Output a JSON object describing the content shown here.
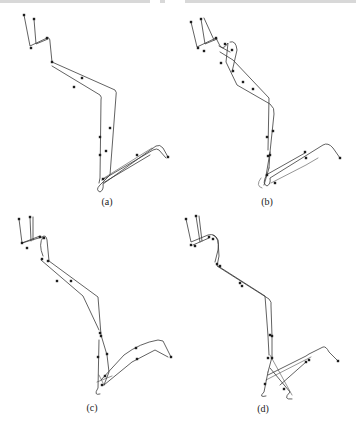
{
  "figure": {
    "top_strip_segments": [
      [
        0,
        150
      ],
      [
        160,
        165
      ],
      [
        185,
        356
      ]
    ],
    "panels": [
      {
        "id": "a",
        "label": "(a)",
        "label_pos": [
          107,
          196
        ],
        "paths": [
          "M24,15 L30,46 L47,38 Q50,37 50,42 L52,62 L115,90 Q117,92 116,96 L110,175 L100,185 Q95,190 100,192 Q104,190 103,184 L156,146 Q160,144 163,148 L168,157",
          "M34,19 L36,44 L48,39",
          "M52,66 L100,95 Q102,97 101,100 L100,178 L99,183",
          "M102,180 L153,150 Q157,148 159,150 L166,158",
          "M103,183 L150,155"
        ],
        "light_paths": [
          "M104,178 L152,148"
        ],
        "nodes": [
          [
            24,
            15
          ],
          [
            34,
            19
          ],
          [
            31,
            48
          ],
          [
            47,
            38
          ],
          [
            52,
            62
          ],
          [
            74,
            87
          ],
          [
            82,
            78
          ],
          [
            100,
            137
          ],
          [
            110,
            128
          ],
          [
            100,
            155
          ],
          [
            106,
            151
          ],
          [
            103,
            179
          ],
          [
            137,
            155
          ],
          [
            168,
            157
          ]
        ]
      },
      {
        "id": "b",
        "label": "(b)",
        "label_pos": [
          267,
          196
        ],
        "paths": [
          "M191,22 L197,47 L216,38 L219,44 Q222,52 228,43 L226,62 L237,85 L270,104 Q275,108 274,114 L270,152 L269,168",
          "M201,19 L205,44 L217,39",
          "M204,18 L214,40",
          "M219,46 L230,52",
          "M230,42 Q236,40 237,50 L232,72",
          "M220,52 L233,60 L269,98 L268,150",
          "M270,152 L266,176 Q262,184 267,186 Q271,184 270,178 L323,145 Q328,142 333,148 L340,158",
          "M269,168 L264,185",
          "M266,175 L305,153"
        ],
        "light_paths": [
          "M261,178 Q255,186 262,188",
          "M271,183 L306,165 L318,158"
        ],
        "nodes": [
          [
            191,
            22
          ],
          [
            201,
            19
          ],
          [
            198,
            48
          ],
          [
            204,
            51
          ],
          [
            216,
            38
          ],
          [
            225,
            44
          ],
          [
            232,
            50
          ],
          [
            221,
            63
          ],
          [
            233,
            71
          ],
          [
            243,
            82
          ],
          [
            253,
            89
          ],
          [
            267,
            137
          ],
          [
            273,
            131
          ],
          [
            268,
            156
          ],
          [
            270,
            155
          ],
          [
            267,
            175
          ],
          [
            275,
            183
          ],
          [
            305,
            152
          ],
          [
            306,
            158
          ],
          [
            340,
            158
          ]
        ]
      },
      {
        "id": "c",
        "label": "(c)",
        "label_pos": [
          92,
          402
        ],
        "paths": [
          "M19,219 L22,243 L42,237 Q46,234 47,240 L49,261 L98,297 L101,335 L107,355 L109,372 L104,385",
          "M30,217 L31,241",
          "M33,217 L33,240",
          "M22,243 L40,236",
          "M43,237 Q38,244 43,256",
          "M41,260 L83,296 L99,330",
          "M99,340 L98,388 Q93,396 100,394",
          "M101,380 L124,355 Q140,343 158,340 L163,341 L171,357",
          "M104,385 L132,362 L155,350 L168,357"
        ],
        "light_paths": [
          "M99,375 L104,385",
          "M97,382 L112,376"
        ],
        "nodes": [
          [
            19,
            219
          ],
          [
            30,
            217
          ],
          [
            22,
            243
          ],
          [
            27,
            248
          ],
          [
            40,
            237
          ],
          [
            44,
            238
          ],
          [
            42,
            259
          ],
          [
            48,
            261
          ],
          [
            57,
            281
          ],
          [
            71,
            281
          ],
          [
            100,
            333
          ],
          [
            101,
            336
          ],
          [
            98,
            357
          ],
          [
            107,
            354
          ],
          [
            105,
            376
          ],
          [
            102,
            385
          ],
          [
            136,
            348
          ],
          [
            137,
            359
          ],
          [
            171,
            357
          ]
        ]
      },
      {
        "id": "d",
        "label": "(d)",
        "label_pos": [
          263,
          403
        ],
        "paths": [
          "M186,219 L191,242 L208,235 Q215,233 218,240 L219,256 L217,266 L269,299 Q272,302 271,306 L272,336 L272,357 L268,372",
          "M196,216 L200,242",
          "M199,216 L202,241",
          "M193,245 L209,238",
          "M213,235 Q220,238 218,250 L215,262",
          "M218,266 L265,296 L268,336 L269,355",
          "M268,372 L264,392 Q258,398 266,396",
          "M270,368 L290,392 Q282,400 292,399",
          "M268,375 L306,356 L309,354 L323,347 Q326,346 329,352 L338,361",
          "M280,385 L306,362"
        ],
        "light_paths": [
          "M270,355 L292,395",
          "M266,380 L311,357"
        ],
        "nodes": [
          [
            186,
            219
          ],
          [
            196,
            216
          ],
          [
            191,
            245
          ],
          [
            195,
            246
          ],
          [
            209,
            237
          ],
          [
            213,
            239
          ],
          [
            217,
            264
          ],
          [
            220,
            266
          ],
          [
            240,
            283
          ],
          [
            242,
            286
          ],
          [
            270,
            335
          ],
          [
            272,
            336
          ],
          [
            268,
            358
          ],
          [
            272,
            358
          ],
          [
            265,
            384
          ],
          [
            284,
            389
          ],
          [
            306,
            362
          ],
          [
            309,
            360
          ],
          [
            338,
            361
          ]
        ]
      }
    ]
  }
}
